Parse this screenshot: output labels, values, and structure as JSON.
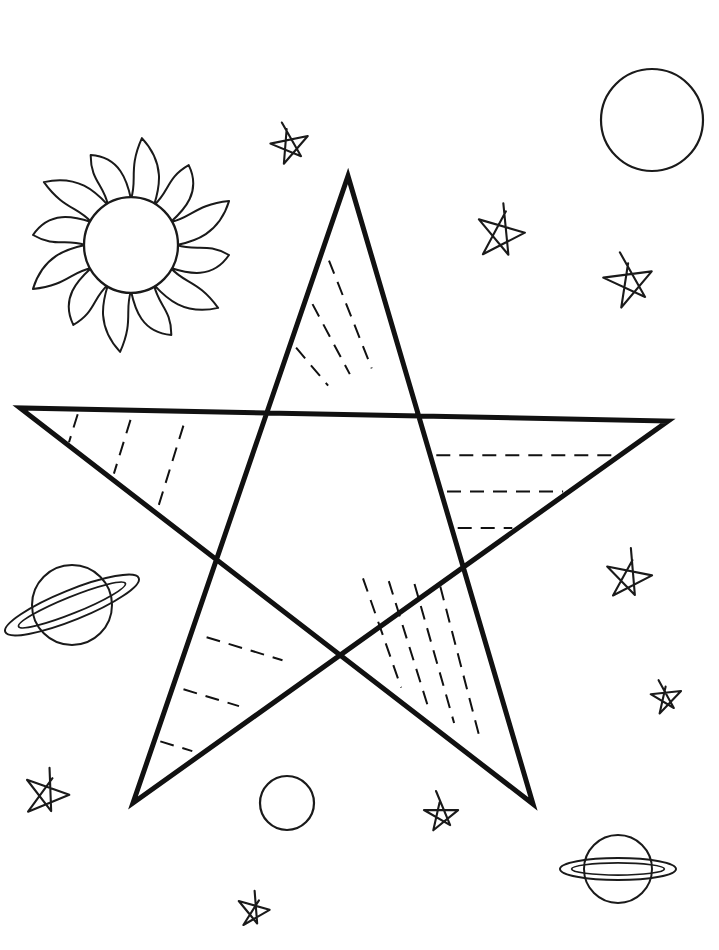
{
  "page": {
    "title": "STAR MAPS",
    "kind": "coloring-page",
    "width": 719,
    "height": 950,
    "background_color": "#ffffff",
    "ink_color": "#1a1a1a"
  },
  "heading": {
    "text": "STAR MAPS",
    "letters": [
      "S",
      "T",
      "A",
      "R",
      "M",
      "A",
      "P",
      "S"
    ],
    "style": "pixel-outline-italic",
    "color": "#111111"
  },
  "main_figure": {
    "name": "five-pointed-star",
    "description": "Large hand-drawn pentagram outline with dashed interior guide lines",
    "stroke_color": "#111111",
    "stroke_width": 5,
    "points": [
      {
        "label": "top",
        "x": 348,
        "y": 176
      },
      {
        "label": "right-arm",
        "x": 668,
        "y": 421
      },
      {
        "label": "bottom-right-leg",
        "x": 533,
        "y": 804
      },
      {
        "label": "bottom-left-leg",
        "x": 133,
        "y": 803
      },
      {
        "label": "left-arm",
        "x": 20,
        "y": 408
      }
    ],
    "dash_color": "#111111",
    "dash_width": 2,
    "dash_pattern": "14 9",
    "dashed_regions": [
      {
        "region": "top-point",
        "count": 3,
        "orientation": "parallel-to-right-edge"
      },
      {
        "region": "left-arm",
        "count": 3,
        "orientation": "parallel-to-lower-edge"
      },
      {
        "region": "right-arm",
        "count": 3,
        "orientation": "horizontal"
      },
      {
        "region": "bottom-left-leg",
        "count": 3,
        "orientation": "parallel-to-lower-edge"
      },
      {
        "region": "bottom-right-leg",
        "count": 4,
        "orientation": "parallel-to-left-edge"
      }
    ]
  },
  "decorations": {
    "sun": {
      "name": "sun",
      "center_x": 131,
      "center_y": 245,
      "core_radius": 47,
      "ray_count": 12,
      "ray_length": 56,
      "stroke_color": "#1a1a1a",
      "stroke_width": 2
    },
    "planets": [
      {
        "name": "saturn-left",
        "center_x": 72,
        "center_y": 605,
        "radius": 40,
        "ring_tilt_deg": -22,
        "ring_rx": 72,
        "ring_ry": 15,
        "stroke_color": "#1a1a1a",
        "stroke_width": 2
      },
      {
        "name": "saturn-bottom-right",
        "center_x": 618,
        "center_y": 869,
        "radius": 34,
        "ring_tilt_deg": 0,
        "ring_rx": 58,
        "ring_ry": 11,
        "stroke_color": "#1a1a1a",
        "stroke_width": 2
      }
    ],
    "moons": [
      {
        "name": "moon-top-right",
        "center_x": 652,
        "center_y": 120,
        "radius": 51
      },
      {
        "name": "moon-bottom-center",
        "center_x": 287,
        "center_y": 803,
        "radius": 27
      }
    ],
    "small_stars": [
      {
        "name": "star-top-center",
        "center_x": 285,
        "center_y": 141,
        "radius": 19,
        "rotation_deg": -14
      },
      {
        "name": "star-upper-right",
        "center_x": 499,
        "center_y": 228,
        "radius": 25,
        "rotation_deg": 10
      },
      {
        "name": "star-right-upper",
        "center_x": 625,
        "center_y": 278,
        "radius": 24,
        "rotation_deg": -12
      },
      {
        "name": "star-right-middle",
        "center_x": 626,
        "center_y": 572,
        "radius": 22,
        "rotation_deg": 8
      },
      {
        "name": "star-right-lower",
        "center_x": 662,
        "center_y": 694,
        "radius": 15,
        "rotation_deg": -9
      },
      {
        "name": "star-bottom-left",
        "center_x": 44,
        "center_y": 789,
        "radius": 22,
        "rotation_deg": 16
      },
      {
        "name": "star-bottom-center",
        "center_x": 437,
        "center_y": 810,
        "radius": 17,
        "rotation_deg": -6
      },
      {
        "name": "star-bottom-low",
        "center_x": 252,
        "center_y": 906,
        "radius": 16,
        "rotation_deg": 12
      }
    ]
  }
}
